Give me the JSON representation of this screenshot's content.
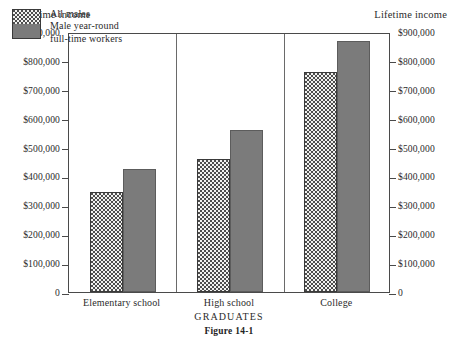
{
  "figure": {
    "caption": "Figure 14-1"
  },
  "axes": {
    "left_title": "Lifetime income",
    "right_title": "Lifetime income",
    "x_title": "GRADUATES"
  },
  "legend": {
    "items": [
      {
        "label": "All males",
        "swatch": "dotted-pattern-swatch"
      },
      {
        "label": "Male year-round",
        "swatch": "gray-solid-swatch"
      },
      {
        "label": "full-time workers",
        "swatch": "gray-solid-swatch-cont"
      }
    ]
  },
  "chart_data": {
    "type": "bar",
    "title": "Figure 14-1",
    "xlabel": "GRADUATES",
    "ylabel": "Lifetime income",
    "categories": [
      "Elementary school",
      "High school",
      "College"
    ],
    "series": [
      {
        "name": "All males",
        "values": [
          345000,
          460000,
          760000
        ]
      },
      {
        "name": "Male year-round full-time workers",
        "values": [
          425000,
          560000,
          870000
        ]
      }
    ],
    "ylim": [
      0,
      900000
    ],
    "ytick_values": [
      900000,
      800000,
      700000,
      600000,
      500000,
      400000,
      300000,
      200000,
      100000,
      0
    ],
    "ytick_labels": [
      "$900,000",
      "$800,000",
      "$700,000",
      "$600,000",
      "$500,000",
      "$400,000",
      "$300,000",
      "$200,000",
      "$100,000",
      "0"
    ],
    "grid": false,
    "legend_position": "upper-left-inside",
    "colors": {
      "all_males_fill": "#f2f2f0",
      "all_males_pattern": "#4d4d4d",
      "fulltime_fill": "#7b7b7b",
      "axis": "#4a4a4a",
      "text": "#2b2b2b",
      "background": "#ffffff"
    }
  }
}
